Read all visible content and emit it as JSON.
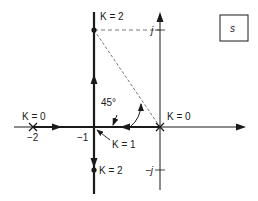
{
  "diagram": {
    "type": "root-locus",
    "plane_label": "s",
    "labels": {
      "k0_left": "K = 0",
      "k0_right": "K = 0",
      "k2_top": "K = 2",
      "k2_bottom": "K = 2",
      "k1": "K = 1",
      "angle": "45°",
      "tick_neg2": "−2",
      "tick_neg1": "−1",
      "tick_j": "j",
      "tick_neg_j": "−j"
    },
    "poles": [
      {
        "real": -2,
        "imag": 0,
        "label": "K = 0"
      },
      {
        "real": 0,
        "imag": 0,
        "label": "K = 0"
      }
    ],
    "breakaway": {
      "real": -1,
      "imag": 0,
      "label": "K = 1"
    },
    "points": [
      {
        "real": -1,
        "imag": 1,
        "label": "K = 2"
      },
      {
        "real": -1,
        "imag": -1,
        "label": "K = 2"
      }
    ],
    "angle_annotation": "45°",
    "colors": {
      "line": "#1a1a1a",
      "dashed": "#555555"
    }
  }
}
